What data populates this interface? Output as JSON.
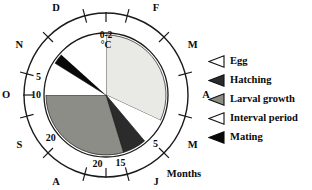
{
  "chart_data": {
    "type": "pie",
    "title": "",
    "subtitle": "",
    "center_label_line1": "0-2",
    "center_label_line2": "°C",
    "axis_caption": "Months",
    "grid": false,
    "legend_position": "right",
    "note": "Circular polar life-cycle diagram. Outer annulus carries month initials (clockwise from top = January). Inner disc is a pie of life-cycle stages. Scale numbers 5, 10, 15, 20 printed inside the ring.",
    "month_ring": [
      {
        "label": "J",
        "angle_deg": 0
      },
      {
        "label": "F",
        "angle_deg": 30
      },
      {
        "label": "M",
        "angle_deg": 60
      },
      {
        "label": "A",
        "angle_deg": 90
      },
      {
        "label": "M",
        "angle_deg": 120
      },
      {
        "label": "J",
        "angle_deg": 150
      },
      {
        "label": "J",
        "angle_deg": 180
      },
      {
        "label": "A",
        "angle_deg": 210
      },
      {
        "label": "S",
        "angle_deg": 240
      },
      {
        "label": "O",
        "angle_deg": 270
      },
      {
        "label": "N",
        "angle_deg": 300
      },
      {
        "label": "D",
        "angle_deg": 330
      }
    ],
    "scale_labels": [
      {
        "value": "5",
        "angle_deg": 285
      },
      {
        "value": "10",
        "angle_deg": 270
      },
      {
        "value": "20",
        "angle_deg": 232
      },
      {
        "value": "20",
        "angle_deg": 187
      },
      {
        "value": "15",
        "angle_deg": 168
      },
      {
        "value": "5",
        "angle_deg": 135
      }
    ],
    "categories": [
      "Egg",
      "Hatching",
      "Larval growth",
      "Interval period",
      "Mating"
    ],
    "values": [
      32,
      6,
      27,
      30,
      5
    ],
    "sectors": [
      {
        "name": "Egg",
        "start_deg": 0,
        "end_deg": 115,
        "fill": "#e9e9e5"
      },
      {
        "name": "Interval period",
        "start_deg": 115,
        "end_deg": 140,
        "fill": "#ffffff"
      },
      {
        "name": "Hatching",
        "start_deg": 140,
        "end_deg": 163,
        "fill": "#2b2b2b"
      },
      {
        "name": "Larval growth",
        "start_deg": 163,
        "end_deg": 270,
        "fill": "#8d8d87"
      },
      {
        "name": "Interval period ",
        "start_deg": 270,
        "end_deg": 302,
        "fill": "#ffffff"
      },
      {
        "name": "Mating",
        "start_deg": 302,
        "end_deg": 312,
        "fill": "#090909"
      },
      {
        "name": "Interval period  ",
        "start_deg": 312,
        "end_deg": 360,
        "fill": "#ffffff"
      }
    ]
  },
  "legend": {
    "items": [
      {
        "label": "Egg",
        "marker": "triangle-left-outline",
        "fill": "#ffffff",
        "stroke": "#101010"
      },
      {
        "label": "Hatching",
        "marker": "triangle-left-dark",
        "fill": "#2b2b2b",
        "stroke": "#101010"
      },
      {
        "label": "Larval growth",
        "marker": "triangle-left-gray",
        "fill": "#8d8d87",
        "stroke": "#101010"
      },
      {
        "label": "Interval period",
        "marker": "triangle-left-outline",
        "fill": "#ffffff",
        "stroke": "#101010"
      },
      {
        "label": "Mating",
        "marker": "triangle-left-black",
        "fill": "#090909",
        "stroke": "#090909"
      }
    ]
  }
}
